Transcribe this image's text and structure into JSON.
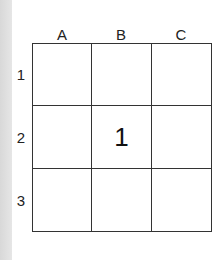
{
  "grid": {
    "columns": [
      "A",
      "B",
      "C"
    ],
    "rows": [
      "1",
      "2",
      "3"
    ],
    "cells": [
      [
        "",
        "",
        ""
      ],
      [
        "",
        "1",
        ""
      ],
      [
        "",
        "",
        ""
      ]
    ]
  }
}
